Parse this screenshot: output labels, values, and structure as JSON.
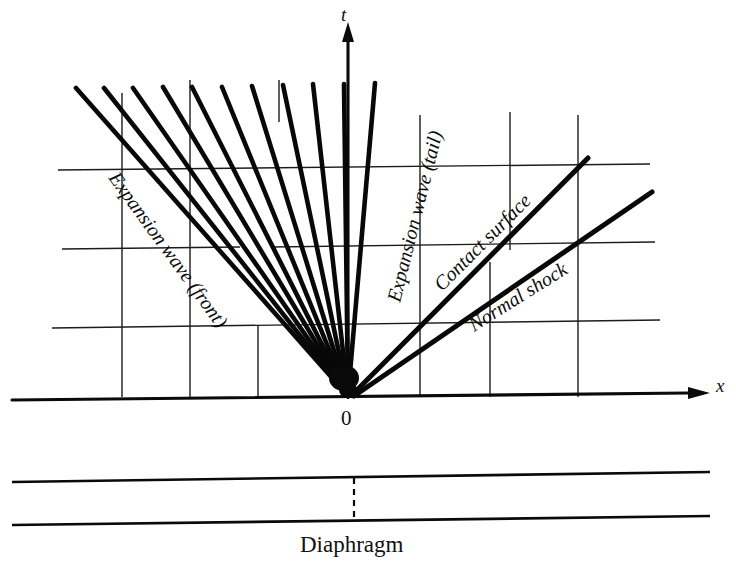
{
  "figure": {
    "width": 736,
    "height": 568,
    "background": "#ffffff",
    "ink_color": "#0a0a0a"
  },
  "axes": {
    "x_axis": {
      "label": "x",
      "label_x": 717,
      "label_y": 391,
      "y": 397,
      "x_start": 12,
      "x_end": 690,
      "arrow": true
    },
    "y_axis": {
      "label": "t",
      "label_x": 343,
      "label_y": 20,
      "x": 348,
      "y_start": 397,
      "y_end": 32,
      "arrow": true
    },
    "origin": {
      "label": "0",
      "x": 348,
      "y": 397,
      "label_x": 342,
      "label_y": 424
    }
  },
  "grid": {
    "visible": true,
    "color": "#1c1c1c",
    "vertical_lines": [
      {
        "x": 122,
        "y_top": 93,
        "y_bottom": 397
      },
      {
        "x": 190,
        "y_top": 80,
        "y_bottom": 397
      },
      {
        "x": 258,
        "y_top": 325,
        "y_bottom": 397
      },
      {
        "x": 279,
        "y_top": 80,
        "y_bottom": 120
      },
      {
        "x": 348,
        "y_top": 32,
        "y_bottom": 397
      },
      {
        "x": 420,
        "y_top": 115,
        "y_bottom": 397
      },
      {
        "x": 490,
        "y_top": 260,
        "y_bottom": 397
      },
      {
        "x": 510,
        "y_top": 110,
        "y_bottom": 250
      },
      {
        "x": 578,
        "y_top": 115,
        "y_bottom": 397
      }
    ],
    "horizontal_lines": [
      {
        "y": 168,
        "x_start": 58,
        "x_end": 650
      },
      {
        "y": 247,
        "x_start": 62,
        "x_end": 240
      },
      {
        "y": 247,
        "x_start": 272,
        "x_end": 655
      },
      {
        "y": 325,
        "x_start": 52,
        "x_end": 660
      }
    ]
  },
  "waves": {
    "expansion_fan": {
      "label_front": "Expansion wave (front)",
      "label_tail": "Expansion wave (tail)",
      "apex_x": 348,
      "apex_y": 396,
      "ray_count": 11,
      "rays": [
        {
          "x_top": 76,
          "y_top": 88
        },
        {
          "x_top": 104,
          "y_top": 88
        },
        {
          "x_top": 133,
          "y_top": 88
        },
        {
          "x_top": 163,
          "y_top": 87
        },
        {
          "x_top": 192,
          "y_top": 87
        },
        {
          "x_top": 222,
          "y_top": 87
        },
        {
          "x_top": 252,
          "y_top": 86
        },
        {
          "x_top": 283,
          "y_top": 85
        },
        {
          "x_top": 313,
          "y_top": 84
        },
        {
          "x_top": 344,
          "y_top": 84
        },
        {
          "x_top": 375,
          "y_top": 83
        }
      ]
    },
    "contact_surface": {
      "label": "Contact surface",
      "x_start": 352,
      "y_start": 395,
      "x_end": 588,
      "y_end": 158
    },
    "normal_shock": {
      "label": "Normal shock",
      "x_start": 354,
      "y_start": 396,
      "x_end": 652,
      "y_end": 192
    }
  },
  "labels": {
    "expansion_front": {
      "text": "Expansion wave (front)",
      "x": 108,
      "y": 178,
      "rotation": 54
    },
    "expansion_tail": {
      "text": "Expansion wave (tail)",
      "x": 400,
      "y": 300,
      "rotation": -76
    },
    "contact_surface": {
      "text": "Contact surface",
      "x": 443,
      "y": 290,
      "rotation": -45
    },
    "normal_shock": {
      "text": "Normal shock",
      "x": 473,
      "y": 330,
      "rotation": -32
    }
  },
  "tube": {
    "label": "Diaphragm",
    "label_x": 300,
    "label_y": 551,
    "top_line": {
      "x_start": 12,
      "y_start": 481,
      "x_end": 710,
      "y_end": 472
    },
    "bottom_line": {
      "x_start": 12,
      "y_start": 524,
      "x_end": 710,
      "y_end": 516
    },
    "diaphragm": {
      "x": 354,
      "y_top": 477,
      "y_bottom": 520
    }
  }
}
